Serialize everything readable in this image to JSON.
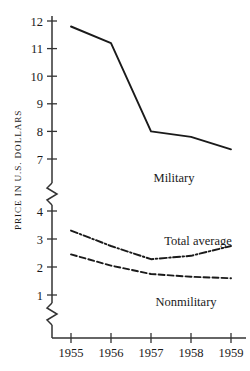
{
  "chart_data": {
    "type": "line",
    "title": "",
    "xlabel": "",
    "ylabel": "PRICE IN U.S. DOLLARS",
    "x": [
      "1955",
      "1956",
      "1957",
      "1958",
      "1959"
    ],
    "categories": [
      "1955",
      "1956",
      "1957",
      "1958",
      "1959"
    ],
    "yticks_upper": [
      "12",
      "11",
      "10",
      "9",
      "8",
      "7"
    ],
    "yticks_lower": [
      "4",
      "3",
      "2",
      "1"
    ],
    "ylim_upper": [
      7,
      12
    ],
    "ylim_lower": [
      1,
      4
    ],
    "axis_break": true,
    "axis_break_count": 2,
    "grid": false,
    "legend_position": "inline-right",
    "series": [
      {
        "name": "Military",
        "style": "solid",
        "values": [
          11.8,
          11.2,
          8.0,
          7.8,
          7.35
        ]
      },
      {
        "name": "Total average",
        "style": "dash-dot",
        "values": [
          3.3,
          2.75,
          2.28,
          2.4,
          2.75
        ]
      },
      {
        "name": "Nonmilitary",
        "style": "dashed",
        "values": [
          2.45,
          2.05,
          1.75,
          1.65,
          1.6
        ]
      }
    ],
    "annotations": [
      {
        "text": "Military",
        "series": "Military"
      },
      {
        "text": "Total average",
        "series": "Total average"
      },
      {
        "text": "Nonmilitary",
        "series": "Nonmilitary"
      }
    ],
    "colors": {
      "line": "#1a1a1a",
      "axis": "#333333",
      "background": "#ffffff"
    }
  }
}
